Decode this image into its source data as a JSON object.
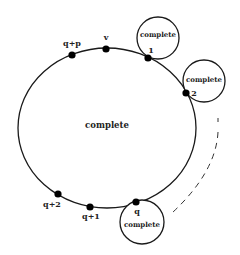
{
  "diagram": {
    "type": "graph-structure",
    "colors": {
      "stroke": "#1a1a1a",
      "text": "#222222",
      "background": "#ffffff"
    },
    "main_circle": {
      "label": "complete",
      "cx": 107,
      "cy": 128,
      "rx": 89,
      "ry": 80
    },
    "vertices": [
      {
        "id": "q+p",
        "label": "q+p",
        "x": 72,
        "y": 55,
        "lx": 72,
        "ly": 46
      },
      {
        "id": "v",
        "label": "v",
        "x": 106,
        "y": 49,
        "lx": 106,
        "ly": 40
      },
      {
        "id": "1",
        "label": "1",
        "x": 148,
        "y": 58,
        "lx": 151,
        "ly": 53
      },
      {
        "id": "2",
        "label": "2",
        "x": 186,
        "y": 93,
        "lx": 194,
        "ly": 96
      },
      {
        "id": "q",
        "label": "q",
        "x": 136,
        "y": 202,
        "lx": 137,
        "ly": 214
      },
      {
        "id": "q+1",
        "label": "q+1",
        "x": 90,
        "y": 207,
        "lx": 91,
        "ly": 219
      },
      {
        "id": "q+2",
        "label": "q+2",
        "x": 58,
        "y": 194,
        "lx": 52,
        "ly": 207
      }
    ],
    "attached_circles": [
      {
        "id": "c1",
        "attached_to": "1",
        "label": "complete",
        "cx": 158,
        "cy": 38,
        "r": 21,
        "lx": 158,
        "ly": 37
      },
      {
        "id": "c2",
        "attached_to": "2",
        "label": "complete",
        "cx": 204,
        "cy": 81,
        "r": 21,
        "lx": 204,
        "ly": 82
      },
      {
        "id": "cq",
        "attached_to": "q",
        "label": "complete",
        "cx": 142,
        "cy": 222,
        "r": 22,
        "lx": 142,
        "ly": 227
      }
    ],
    "dashed_arc": {
      "meaning": "continuation of attached complete subgraphs from 2 to q",
      "path": "M 218 118 L 218 122 M 218 132 Q 216 172 172 213"
    }
  }
}
